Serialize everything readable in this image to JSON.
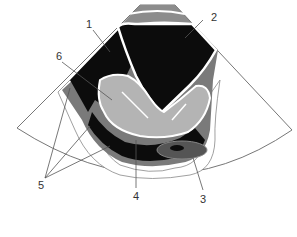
{
  "diagram": {
    "type": "ultrasound-schematic",
    "labels": [
      {
        "id": "1",
        "text": "1",
        "x": 87,
        "y": 19
      },
      {
        "id": "2",
        "text": "2",
        "x": 211,
        "y": 12
      },
      {
        "id": "3",
        "text": "3",
        "x": 200,
        "y": 194
      },
      {
        "id": "4",
        "text": "4",
        "x": 132,
        "y": 191
      },
      {
        "id": "5",
        "text": "5",
        "x": 38,
        "y": 180
      },
      {
        "id": "6",
        "text": "6",
        "x": 56,
        "y": 51
      }
    ],
    "colors": {
      "black": "#0c0c0c",
      "dark_gray": "#6e6e6e",
      "mid_gray": "#8c8c8c",
      "light_gray": "#b4b4b4",
      "outline": "#666666"
    }
  }
}
